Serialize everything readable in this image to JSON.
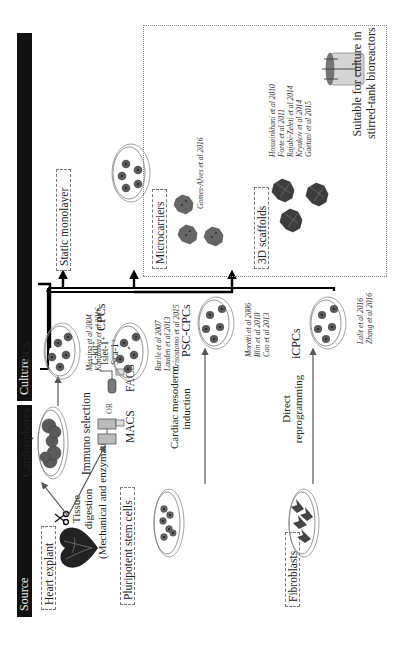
{
  "figure": {
    "orientation": "rotated-90-ccw",
    "sections": {
      "source_label": "Source",
      "culture_label": "Culture"
    }
  },
  "source": {
    "heart_explant": {
      "title": "Heart explant",
      "step": [
        "Tissue",
        "digestion",
        "(Mechanical and enzymatic)"
      ],
      "cardiospheres_label": "Cardiospheres",
      "immuno_selection_label": "Immuno selection",
      "or_label": "OR",
      "macs_label": "MACS",
      "facs_label": "FACS",
      "markers": [
        "C-kit⁺",
        "Islet-1⁺",
        "Sca-1⁺"
      ]
    },
    "pluripotent": {
      "title": "Pluripotent stem cells",
      "step": [
        "Cardiac mesoderm",
        "induction"
      ]
    },
    "fibroblasts": {
      "title": "Fibroblasts",
      "step": [
        "Direct",
        "reprogramming"
      ]
    }
  },
  "cell_types": [
    {
      "name": "CDCs",
      "citations": [
        "Messina et al 2004",
        "Kanazawa et al 2016"
      ]
    },
    {
      "name": "CPCs",
      "citations": [
        "Barile et al 2007",
        "Lauden et al 2013",
        "Crisostomo et al 2015"
      ]
    },
    {
      "name": "PSC-CPCs",
      "citations": [
        "Moretti et al 2006",
        "Blin et al 2010",
        "Cao et al 2013"
      ]
    },
    {
      "name": "iCPCs",
      "citations": [
        "Lalit et al 2016",
        "Zhang et al 2016"
      ]
    }
  ],
  "culture": {
    "static_monolayer": {
      "title": "Static monolayer"
    },
    "microcarriers": {
      "title": "Microcarriers",
      "citations": [
        "Gomes-Alves et al 2016"
      ]
    },
    "scaffolds_3d": {
      "title": "3D scaffolds",
      "citations": [
        "Hosseinkhani et al 2010",
        "Forte et al 2011",
        "Rajabi-Zeleti et al 2014",
        "Kryukov et al 2014",
        "Gaetani et al 2015"
      ]
    },
    "bioreactor_note": [
      "Suitable for culture in",
      "stirred-tank bioreactors"
    ]
  },
  "colors": {
    "header_bg": "#111111",
    "header_text": "#f2f2f2",
    "cell_fill": "#555555",
    "cell_core": "#222222",
    "dish_stroke": "#9a9a9a",
    "arrow_thin": "#555555",
    "arrow_thick": "#000000"
  }
}
